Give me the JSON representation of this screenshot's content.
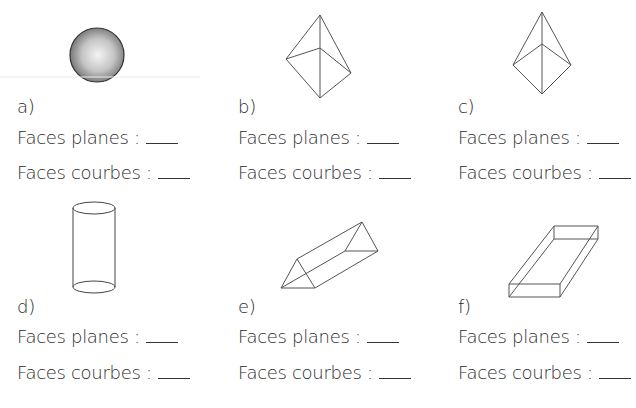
{
  "worksheet": {
    "items": [
      {
        "letter": "a)",
        "shape": "sphere-icon",
        "planes_label": "Faces planes :",
        "courbes_label": "Faces courbes :",
        "planes_answer": "",
        "courbes_answer": ""
      },
      {
        "letter": "b)",
        "shape": "pyramid-icon",
        "planes_label": "Faces planes :",
        "courbes_label": "Faces courbes :",
        "planes_answer": "",
        "courbes_answer": ""
      },
      {
        "letter": "c)",
        "shape": "pyramid-icon",
        "planes_label": "Faces planes :",
        "courbes_label": "Faces courbes :",
        "planes_answer": "",
        "courbes_answer": ""
      },
      {
        "letter": "d)",
        "shape": "cylinder-icon",
        "planes_label": "Faces planes :",
        "courbes_label": "Faces courbes :",
        "planes_answer": "",
        "courbes_answer": ""
      },
      {
        "letter": "e)",
        "shape": "triangular-prism-icon",
        "planes_label": "Faces planes :",
        "courbes_label": "Faces courbes :",
        "planes_answer": "",
        "courbes_answer": ""
      },
      {
        "letter": "f)",
        "shape": "rectangular-prism-icon",
        "planes_label": "Faces planes :",
        "courbes_label": "Faces courbes :",
        "planes_answer": "",
        "courbes_answer": ""
      }
    ]
  }
}
